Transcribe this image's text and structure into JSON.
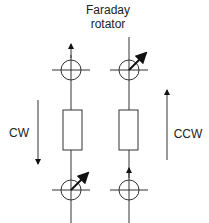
{
  "title": {
    "line1": "Faraday",
    "line2": "rotator"
  },
  "left_label": "CW",
  "right_label": "CCW",
  "colors": {
    "stroke": "#333333",
    "arrow": "#111111"
  }
}
